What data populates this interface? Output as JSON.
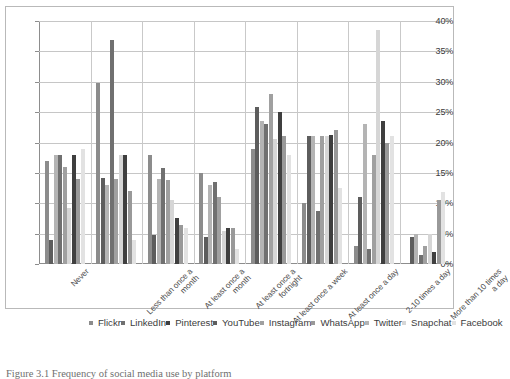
{
  "chart_data": {
    "type": "bar",
    "title": "",
    "xlabel": "",
    "ylabel": "",
    "ylim": [
      0,
      40
    ],
    "ytick_labels": [
      "0%",
      "5%",
      "10%",
      "15%",
      "20%",
      "25%",
      "30%",
      "35%",
      "40%"
    ],
    "ytick_values": [
      0,
      5,
      10,
      15,
      20,
      25,
      30,
      35,
      40
    ],
    "grid": true,
    "legend_position": "bottom",
    "categories": [
      "Never",
      "Less than once a month",
      "At least once a month",
      "At least once a fortnight",
      "At least once a week",
      "At least once a day",
      "2-10 times a day",
      "More than 10 times a day"
    ],
    "series": [
      {
        "name": "Flickr",
        "color": "#8c8c8c",
        "values": [
          17.0,
          29.8,
          18.0,
          15.0,
          19.0,
          10.0,
          3.0,
          0.0
        ]
      },
      {
        "name": "YouTube",
        "color": "#5d5d5d",
        "values": [
          4.0,
          14.2,
          4.8,
          4.5,
          25.8,
          21.0,
          11.0,
          4.5
        ]
      },
      {
        "name": "Twitter",
        "color": "#b4b4b4",
        "values": [
          18.0,
          13.0,
          14.0,
          13.0,
          23.5,
          21.0,
          23.0,
          5.0
        ]
      },
      {
        "name": "LinkedIn",
        "color": "#707070",
        "values": [
          18.0,
          36.8,
          15.8,
          13.5,
          23.0,
          8.8,
          2.5,
          1.5
        ]
      },
      {
        "name": "Instagram",
        "color": "#a0a0a0",
        "values": [
          16.0,
          14.0,
          13.8,
          11.0,
          28.0,
          21.0,
          18.0,
          3.0
        ]
      },
      {
        "name": "Snapchat",
        "color": "#d6d6d6",
        "values": [
          9.2,
          18.0,
          10.5,
          5.5,
          20.5,
          21.0,
          38.6,
          5.0
        ]
      },
      {
        "name": "Pinterest",
        "color": "#3f3f3f",
        "values": [
          18.0,
          18.0,
          7.5,
          6.0,
          25.0,
          21.2,
          23.5,
          2.0
        ]
      },
      {
        "name": "WhatsApp",
        "color": "#999999",
        "values": [
          14.0,
          12.0,
          6.5,
          6.0,
          21.0,
          22.0,
          20.0,
          10.5
        ]
      },
      {
        "name": "Facebook",
        "color": "#e2e2e2",
        "values": [
          19.0,
          4.0,
          6.0,
          2.5,
          18.0,
          12.5,
          21.0,
          11.8
        ]
      }
    ]
  },
  "legend": {
    "entries": [
      {
        "label": "Flickr",
        "color": "#8c8c8c"
      },
      {
        "label": "LinkedIn",
        "color": "#707070"
      },
      {
        "label": "Pinterest",
        "color": "#3f3f3f"
      },
      {
        "label": "YouTube",
        "color": "#5d5d5d"
      },
      {
        "label": "Instagram",
        "color": "#a0a0a0"
      },
      {
        "label": "WhatsApp",
        "color": "#999999"
      },
      {
        "label": "Twitter",
        "color": "#b4b4b4"
      },
      {
        "label": "Snapchat",
        "color": "#d6d6d6"
      },
      {
        "label": "Facebook",
        "color": "#e2e2e2"
      }
    ]
  },
  "caption": {
    "text": "Figure 3.1   Frequency of social media use by platform"
  }
}
